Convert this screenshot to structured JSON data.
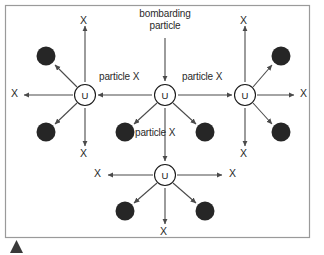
{
  "figure": {
    "frame": {
      "border_color": "#9a9a9a",
      "background": "#ffffff",
      "x": 5,
      "y": 5,
      "width": 305,
      "height": 233
    },
    "corner_marker": {
      "name": "bottom-left-triangle-marker",
      "color": "#3a3a3a",
      "x": 10,
      "y": 240,
      "size": 13
    }
  },
  "colors": {
    "line": "#4a4a4a",
    "nucleus_fill": "#ffffff",
    "nucleus_stroke": "#1a1a1a",
    "fragment_fill": "#262626",
    "text": "#2a2a2a",
    "frame": "#9a9a9a"
  },
  "nuclei": [
    {
      "id": "center",
      "label": "U",
      "cx": 165,
      "cy": 95,
      "r": 10.5
    },
    {
      "id": "left",
      "label": "U",
      "cx": 85,
      "cy": 95,
      "r": 10.5
    },
    {
      "id": "right",
      "label": "U",
      "cx": 245,
      "cy": 95,
      "r": 10.5
    },
    {
      "id": "bottom",
      "label": "U",
      "cx": 165,
      "cy": 175,
      "r": 10.5
    }
  ],
  "fragments": [
    {
      "id": "left-upper",
      "cx": 46,
      "cy": 56,
      "r": 9.5
    },
    {
      "id": "left-lower",
      "cx": 46,
      "cy": 132,
      "r": 9.5
    },
    {
      "id": "center-lower-left",
      "cx": 125,
      "cy": 132,
      "r": 9.5
    },
    {
      "id": "center-lower-right",
      "cx": 205,
      "cy": 132,
      "r": 9.5
    },
    {
      "id": "right-upper",
      "cx": 281,
      "cy": 56,
      "r": 9.5
    },
    {
      "id": "right-lower",
      "cx": 281,
      "cy": 132,
      "r": 9.5
    },
    {
      "id": "bottom-lower-left",
      "cx": 125,
      "cy": 211,
      "r": 9.5
    },
    {
      "id": "bottom-lower-right",
      "cx": 205,
      "cy": 211,
      "r": 9.5
    }
  ],
  "labels": {
    "bombarding_particle": "bombarding\nparticle",
    "bombarding_line1": "bombarding",
    "bombarding_line2": "particle",
    "particle_x_left": "particle X",
    "particle_x_right": "particle X",
    "particle_x_bottom": "particle X",
    "x_marks": [
      {
        "id": "x-left-top",
        "text": "X",
        "x": 80,
        "y": 15
      },
      {
        "id": "x-right-top",
        "text": "X",
        "x": 240,
        "y": 15
      },
      {
        "id": "x-far-left",
        "text": "X",
        "x": 11,
        "y": 88
      },
      {
        "id": "x-far-right",
        "text": "X",
        "x": 300,
        "y": 88
      },
      {
        "id": "x-left-bottom",
        "text": "X",
        "x": 80,
        "y": 153
      },
      {
        "id": "x-right-bottom",
        "text": "X",
        "x": 240,
        "y": 153
      },
      {
        "id": "x-bottom-left",
        "text": "X",
        "x": 94,
        "y": 168
      },
      {
        "id": "x-bottom-right",
        "text": "X",
        "x": 229,
        "y": 168
      },
      {
        "id": "x-bottom-down",
        "text": "X",
        "x": 160,
        "y": 230
      }
    ]
  },
  "arrows": {
    "bombard_in": {
      "from_x": 165,
      "from_y": 38,
      "to_x": 165,
      "to_y": 81
    },
    "chain": [
      {
        "id": "center-to-left",
        "from_x": 152,
        "from_y": 95,
        "to_x": 98,
        "to_y": 95
      },
      {
        "id": "center-to-right",
        "from_x": 178,
        "from_y": 95,
        "to_x": 232,
        "to_y": 95
      },
      {
        "id": "center-to-bottom",
        "from_x": 165,
        "from_y": 108,
        "to_x": 165,
        "to_y": 161
      }
    ],
    "emissions": [
      {
        "id": "left-up",
        "from_x": 85,
        "from_y": 82,
        "to_x": 85,
        "to_y": 26
      },
      {
        "id": "left-down",
        "from_x": 85,
        "from_y": 108,
        "to_x": 85,
        "to_y": 146
      },
      {
        "id": "left-west",
        "from_x": 73,
        "from_y": 95,
        "to_x": 24,
        "to_y": 95
      },
      {
        "id": "left-nw",
        "from_x": 77,
        "from_y": 87,
        "to_x": 55,
        "to_y": 65
      },
      {
        "id": "left-sw",
        "from_x": 77,
        "from_y": 103,
        "to_x": 55,
        "to_y": 124
      },
      {
        "id": "right-up",
        "from_x": 245,
        "from_y": 82,
        "to_x": 245,
        "to_y": 26
      },
      {
        "id": "right-down",
        "from_x": 245,
        "from_y": 108,
        "to_x": 245,
        "to_y": 146
      },
      {
        "id": "right-east",
        "from_x": 257,
        "from_y": 95,
        "to_x": 294,
        "to_y": 95
      },
      {
        "id": "right-ne",
        "from_x": 253,
        "from_y": 87,
        "to_x": 272,
        "to_y": 65
      },
      {
        "id": "right-se",
        "from_x": 253,
        "from_y": 103,
        "to_x": 272,
        "to_y": 124
      },
      {
        "id": "center-sw",
        "from_x": 157,
        "from_y": 103,
        "to_x": 134,
        "to_y": 124
      },
      {
        "id": "center-se",
        "from_x": 173,
        "from_y": 103,
        "to_x": 196,
        "to_y": 124
      },
      {
        "id": "bottom-west",
        "from_x": 153,
        "from_y": 175,
        "to_x": 108,
        "to_y": 175
      },
      {
        "id": "bottom-east",
        "from_x": 177,
        "from_y": 175,
        "to_x": 222,
        "to_y": 175
      },
      {
        "id": "bottom-sw",
        "from_x": 157,
        "from_y": 183,
        "to_x": 134,
        "to_y": 203
      },
      {
        "id": "bottom-se",
        "from_x": 173,
        "from_y": 183,
        "to_x": 196,
        "to_y": 203
      },
      {
        "id": "bottom-down",
        "from_x": 165,
        "from_y": 188,
        "to_x": 165,
        "to_y": 224
      }
    ]
  }
}
